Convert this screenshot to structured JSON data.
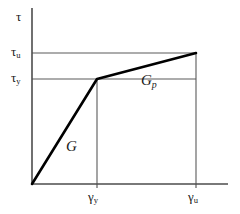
{
  "chart_data": {
    "type": "line",
    "title": "",
    "xlabel": "γ",
    "ylabel": "τ",
    "grid": false,
    "legend": "none",
    "xlim": [
      0,
      1.0
    ],
    "ylim": [
      0,
      1.0
    ],
    "series": [
      {
        "name": "bilinear shear stress-strain curve",
        "x": [
          0,
          0.3313,
          0.8367
        ],
        "y": [
          0,
          0.5966,
          0.7443
        ],
        "points": [
          {
            "label": "origin",
            "x": 0,
            "y": 0
          },
          {
            "label": "yield point",
            "x": 0.3313,
            "y": 0.5966,
            "x_tick": "γy",
            "y_tick": "τy"
          },
          {
            "label": "ultimate point",
            "x": 0.8367,
            "y": 0.7443,
            "x_tick": "γu",
            "y_tick": "τu"
          }
        ]
      }
    ],
    "annotations": [
      {
        "name": "elastic-modulus",
        "text": "G",
        "x": 0.17,
        "y": 0.28
      },
      {
        "name": "plastic-modulus",
        "text": "Gp",
        "x": 0.56,
        "y": 0.64
      }
    ],
    "xticks": [
      {
        "value": 0.3313,
        "label": "γy"
      },
      {
        "value": 0.8367,
        "label": "γu"
      }
    ],
    "yticks": [
      {
        "value": 0.5966,
        "label": "τy"
      },
      {
        "value": 0.7443,
        "label": "τu"
      }
    ]
  },
  "labels": {
    "y_axis_symbol": "τ",
    "tau_u": {
      "base": "τ",
      "sub": "u"
    },
    "tau_y": {
      "base": "τ",
      "sub": "y"
    },
    "gamma_y": {
      "base": "γ",
      "sub": "y"
    },
    "gamma_u": {
      "base": "γ",
      "sub": "u"
    },
    "modulus_elastic": {
      "base": "G",
      "sub": ""
    },
    "modulus_plastic": {
      "base": "G",
      "sub": "p"
    }
  },
  "colors": {
    "curve": "#000000",
    "axis": "#4d4d4d",
    "guide": "#5a5a5a",
    "text": "#1a1a1a",
    "background": "#ffffff"
  },
  "geometry": {
    "origin_px": [
      32,
      184
    ],
    "yield_px": [
      97,
      79
    ],
    "ultimate_px": [
      196,
      53
    ],
    "y_axis_top_px": 8,
    "x_axis_right_px": 228
  }
}
